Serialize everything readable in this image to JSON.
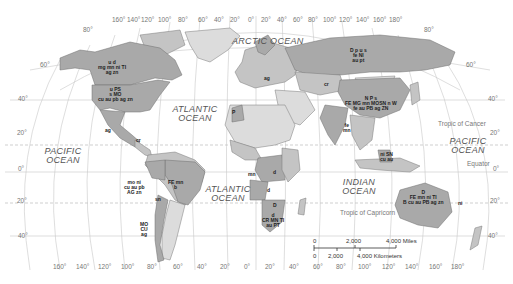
{
  "oceans": {
    "arctic": "ARCTIC OCEAN",
    "atlantic_north": "ATLANTIC OCEAN",
    "atlantic_south": "ATLANTIC OCEAN",
    "pacific_west": "PACIFIC OCEAN",
    "pacific_east": "PACIFIC OCEAN",
    "indian": "INDIAN OCEAN"
  },
  "reference_lines": {
    "tropic_cancer": "Tropic of Cancer",
    "equator": "Equator",
    "tropic_capricorn": "Tropic of Capricorn"
  },
  "longitude_top": [
    "160°",
    "140°",
    "120°",
    "100°",
    "80°",
    "60°",
    "40°",
    "20°",
    "0°",
    "20°",
    "40°",
    "60°",
    "80°",
    "100°",
    "120°",
    "140°",
    "160°",
    "180°"
  ],
  "longitude_bottom": [
    "160°",
    "140°",
    "120°",
    "100°",
    "80°",
    "60°",
    "40°",
    "20°",
    "0°",
    "20°",
    "40°",
    "60°",
    "80°",
    "100°",
    "120°",
    "140°",
    "160°",
    "180°"
  ],
  "latitude_left": [
    "80°",
    "60°",
    "40°",
    "20°",
    "0°",
    "20°",
    "40°"
  ],
  "latitude_right": [
    "80°",
    "60°",
    "40°",
    "20°",
    "0°",
    "20°",
    "40°"
  ],
  "resource_labels": {
    "canada": [
      "u d",
      "mg mn ni TI",
      "ag zn"
    ],
    "usa": [
      "u PS",
      "s MO",
      "cu au pb ag zn"
    ],
    "mexico": [
      "ag"
    ],
    "cuba": [
      "cr"
    ],
    "andes_north": [
      "mo ni",
      "cu au pb",
      "AG zn"
    ],
    "brazil": [
      "FE mn",
      "b"
    ],
    "bolivia": [
      "sn"
    ],
    "chile": [
      "MO",
      "CU",
      "ag"
    ],
    "morocco": [
      "P"
    ],
    "west_africa": [
      "mn"
    ],
    "congo": [
      "d"
    ],
    "angola": [
      "d"
    ],
    "botswana": [
      "D"
    ],
    "south_africa": [
      "d",
      "CR MN TI",
      "au PT"
    ],
    "europe": [
      "ag"
    ],
    "russia": [
      "D p u s",
      "fe NI",
      "au pt"
    ],
    "kazakhstan": [
      "cr"
    ],
    "china": [
      "N P s",
      "FE MG mn MOSN n W",
      "fe au PB ag ZN"
    ],
    "india": [
      "fe",
      "mn"
    ],
    "indonesia": [
      "ni SN",
      "cu au"
    ],
    "australia": [
      "D",
      "FE mn ni TI",
      "B cu au PB ag zn"
    ],
    "pacific_islands": [
      "ni"
    ]
  },
  "scale_bar": {
    "miles_labels": [
      "0",
      "2,000",
      "4,000 Miles"
    ],
    "km_labels": [
      "0",
      "2,000",
      "4,000 Kilometers"
    ]
  },
  "colors": {
    "resource_country": "#a9a9a9",
    "other_country": "#c4c4c4",
    "light_country": "#dcdcdc",
    "border": "#6e6e6e"
  }
}
